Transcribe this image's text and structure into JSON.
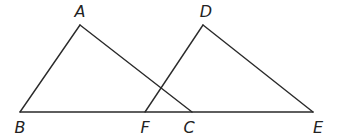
{
  "diagram": {
    "type": "geometry",
    "points": {
      "A": {
        "label": "A",
        "x": 80,
        "y": 25,
        "lx": 80,
        "ly": 17
      },
      "B": {
        "label": "B",
        "x": 20,
        "y": 112,
        "lx": 20,
        "ly": 133
      },
      "F": {
        "label": "F",
        "x": 145,
        "y": 112,
        "lx": 145,
        "ly": 133
      },
      "C": {
        "label": "C",
        "x": 192,
        "y": 112,
        "lx": 189,
        "ly": 133
      },
      "D": {
        "label": "D",
        "x": 203,
        "y": 25,
        "lx": 206,
        "ly": 17
      },
      "E": {
        "label": "E",
        "x": 313,
        "y": 112,
        "lx": 318,
        "ly": 133
      }
    },
    "segments": [
      [
        "A",
        "B"
      ],
      [
        "A",
        "C"
      ],
      [
        "B",
        "E"
      ],
      [
        "D",
        "F"
      ],
      [
        "D",
        "E"
      ]
    ],
    "triangles": [
      "ABC",
      "DFE"
    ],
    "stroke_color": "#2a2a2a",
    "label_color": "#222222"
  }
}
